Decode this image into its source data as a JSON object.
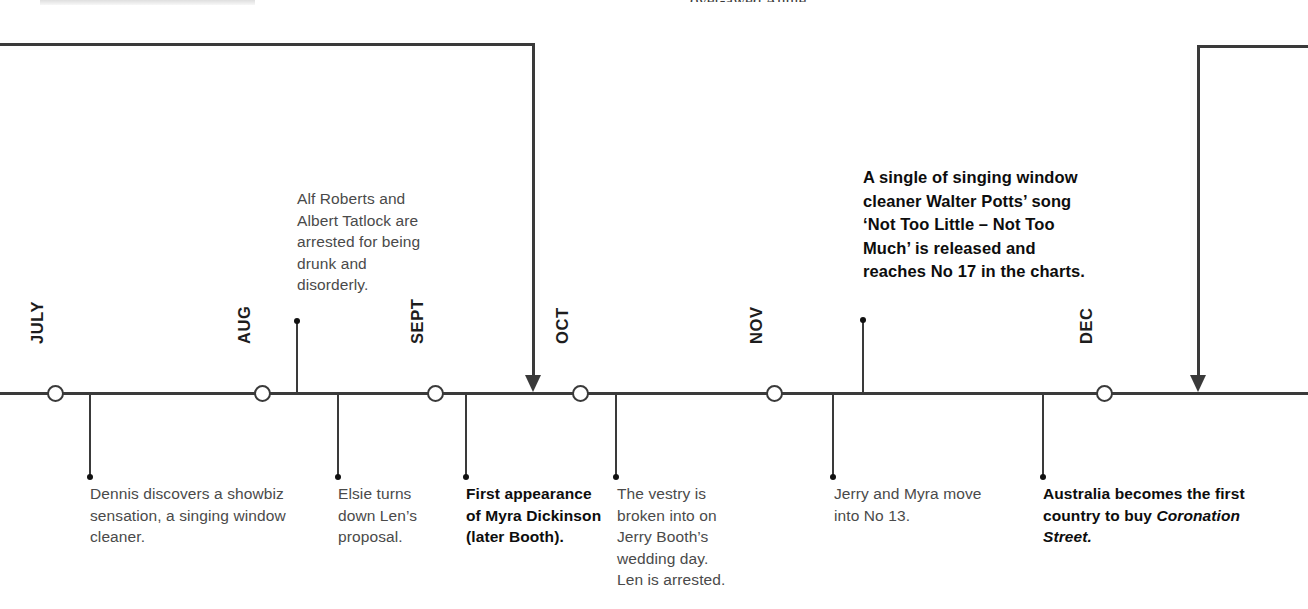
{
  "page": {
    "width": 1308,
    "height": 609,
    "background": "#ffffff",
    "line_color": "#3a3a3a",
    "body_text_color": "#4a4a4a",
    "bold_text_color": "#0d0d0d"
  },
  "cutoff_text": {
    "fragment": "over-awed Annie."
  },
  "timeline": {
    "months": [
      {
        "label": "JULY",
        "x": 55
      },
      {
        "label": "AUG",
        "x": 262
      },
      {
        "label": "SEPT",
        "x": 435
      },
      {
        "label": "OCT",
        "x": 580
      },
      {
        "label": "NOV",
        "x": 774
      },
      {
        "label": "DEC",
        "x": 1104
      }
    ]
  },
  "events": {
    "above": [
      {
        "id": "alf-roberts-arrest",
        "stem_x": 297,
        "text": "Alf Roberts and Albert Tatlock are arrested for being drunk and disorderly.",
        "bold": false
      },
      {
        "id": "walter-potts-single",
        "stem_x": 863,
        "text": "A single of singing window cleaner Walter Potts’ song ‘Not Too Little – Not Too Much’ is released and reaches No 17 in the charts.",
        "bold": true
      }
    ],
    "below": [
      {
        "id": "dennis-discovers-showbiz",
        "stem_x": 90,
        "text": "Dennis discovers a showbiz sensation, a singing window cleaner.",
        "bold": false
      },
      {
        "id": "elsie-turns-down-len",
        "stem_x": 338,
        "text": "Elsie turns down Len’s proposal.",
        "bold": false
      },
      {
        "id": "myra-dickinson-first-appearance",
        "stem_x": 466,
        "text": "First appearance of Myra Dickinson (later Booth).",
        "bold": true
      },
      {
        "id": "vestry-broken-into",
        "stem_x": 616,
        "text": "The vestry is broken into on Jerry Booth’s wedding day. Len is arrested.",
        "bold": false
      },
      {
        "id": "jerry-myra-move-no-13",
        "stem_x": 833,
        "text": "Jerry and Myra move into No 13.",
        "bold": false
      },
      {
        "id": "australia-buys-coronation-street",
        "stem_x": 1043,
        "text_plain": "Australia becomes the first country to buy ",
        "text_italic": "Coronation Street.",
        "bold": true
      }
    ]
  },
  "connectors": [
    {
      "id": "incoming-connector-left",
      "description": "bracket entering from left page edge, turning down into the timeline",
      "from_x": 0,
      "corner_x": 533,
      "top_y": 43,
      "arrow_tip_y": 392
    },
    {
      "id": "outgoing-connector-right",
      "description": "bracket entering from right page edge, turning down into the timeline",
      "from_x": 1308,
      "corner_x": 1198,
      "top_y": 45,
      "arrow_tip_y": 392
    }
  ]
}
